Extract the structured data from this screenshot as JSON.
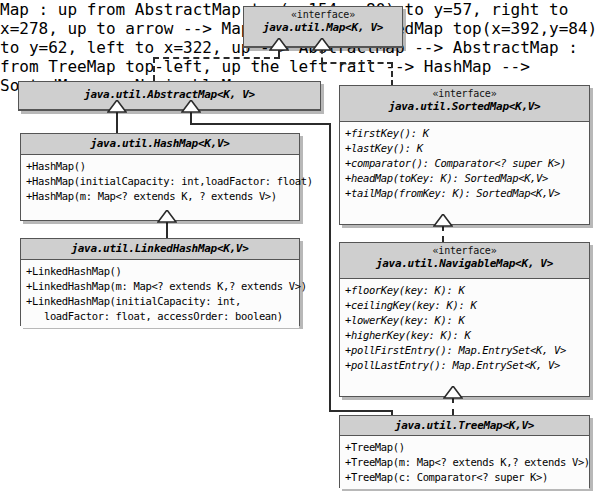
{
  "diagram": {
    "type": "uml-class-diagram",
    "stereotype_label": "«interface»"
  },
  "classes": {
    "map": {
      "stereotype": "«interface»",
      "name": "java.util.Map<K, V>",
      "members": []
    },
    "abstract_map": {
      "stereotype": "",
      "name": "java.util.AbstractMap<K, V>",
      "members": []
    },
    "hash_map": {
      "stereotype": "",
      "name": "java.util.HashMap<K,V>",
      "members": [
        "+HashMap()",
        "+HashMap(initialCapacity: int,loadFactor: float)",
        "+HashMap(m: Map<? extends K, ? extends V>)"
      ]
    },
    "linked_hash_map": {
      "stereotype": "",
      "name": "java.util.LinkedHashMap<K,V>",
      "members": [
        "+LinkedHashMap()",
        "+LinkedHashMap(m: Map<? extends K,? extends V>)",
        "+LinkedHashMap(initialCapacity: int,\n   loadFactor: float, accessOrder: boolean)"
      ]
    },
    "sorted_map": {
      "stereotype": "«interface»",
      "name": "java.util.SortedMap<K,V>",
      "members": [
        "+firstKey(): K",
        "+lastKey(): K",
        "+comparator(): Comparator<? super K>)",
        "+headMap(toKey: K): SortedMap<K,V>",
        "+tailMap(fromKey: K): SortedMap<K,V>"
      ]
    },
    "navigable_map": {
      "stereotype": "«interface»",
      "name": "java.util.NavigableMap<K, V>",
      "members": [
        "+floorKey(key: K): K",
        "+ceilingKey(key: K): K",
        "+lowerKey(key: K): K",
        "+higherKey(key: K): K",
        "+pollFirstEntry(): Map.EntrySet<K, V>",
        "+pollLastEntry(): Map.EntrySet<K, V>"
      ]
    },
    "tree_map": {
      "stereotype": "",
      "name": "java.util.TreeMap<K,V>",
      "members": [
        "+TreeMap()",
        "+TreeMap(m: Map<? extends K,? extends V>)",
        "+TreeMap(c: Comparator<? super K>)"
      ]
    }
  },
  "relations": [
    {
      "from": "java.util.AbstractMap<K, V>",
      "to": "java.util.Map<K, V>",
      "kind": "realization"
    },
    {
      "from": "java.util.SortedMap<K,V>",
      "to": "java.util.Map<K, V>",
      "kind": "realization"
    },
    {
      "from": "java.util.HashMap<K,V>",
      "to": "java.util.AbstractMap<K, V>",
      "kind": "generalization"
    },
    {
      "from": "java.util.TreeMap<K,V>",
      "to": "java.util.AbstractMap<K, V>",
      "kind": "generalization"
    },
    {
      "from": "java.util.LinkedHashMap<K,V>",
      "to": "java.util.HashMap<K,V>",
      "kind": "generalization"
    },
    {
      "from": "java.util.NavigableMap<K, V>",
      "to": "java.util.SortedMap<K,V>",
      "kind": "realization"
    },
    {
      "from": "java.util.TreeMap<K,V>",
      "to": "java.util.NavigableMap<K, V>",
      "kind": "realization"
    }
  ],
  "colors": {
    "header_fill": "#cfcfcf",
    "body_fill": "#fcfcfc",
    "border": "#555555",
    "line": "#2b2b2b",
    "background": "#ffffff"
  }
}
